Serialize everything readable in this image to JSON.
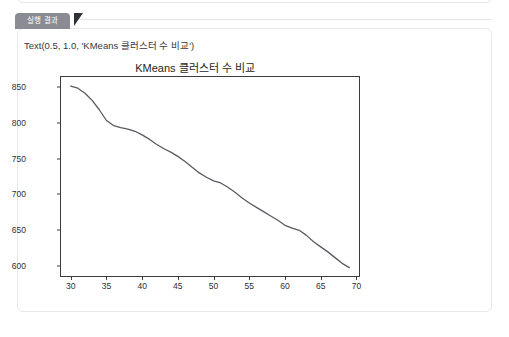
{
  "panel": {
    "tab_label": "실행 결과"
  },
  "output": {
    "repr_text": "Text(0.5, 1.0, 'KMeans 클러스터 수 비교')"
  },
  "colors": {
    "tab_background": "#8b8b93",
    "tab_text": "#ffffff",
    "tab_pointer": "#2f3135",
    "card_background": "#ffffff",
    "card_border": "#e6e8ea",
    "line": "#595b60",
    "axis": "#3b3d41",
    "tick_text": "#2e3034"
  },
  "chart_data": {
    "type": "line",
    "title": "KMeans 클러스터 수 비교",
    "xlabel": "",
    "ylabel": "",
    "xlim": [
      28.5,
      70.5
    ],
    "ylim": [
      585,
      865
    ],
    "grid": false,
    "legend": null,
    "xticks": [
      30,
      35,
      40,
      45,
      50,
      55,
      60,
      65,
      70
    ],
    "yticks": [
      600,
      650,
      700,
      750,
      800,
      850
    ],
    "series": [
      {
        "name": "inertia",
        "color": "#595b60",
        "x": [
          30,
          31,
          32,
          33,
          34,
          35,
          36,
          37,
          38,
          39,
          40,
          41,
          42,
          43,
          44,
          45,
          46,
          47,
          48,
          49,
          50,
          51,
          52,
          53,
          54,
          55,
          56,
          57,
          58,
          59,
          60,
          61,
          62,
          63,
          64,
          65,
          66,
          67,
          68,
          69
        ],
        "y": [
          851,
          848,
          841,
          831,
          818,
          803,
          796,
          793,
          791,
          788,
          783,
          777,
          770,
          764,
          759,
          753,
          746,
          738,
          730,
          724,
          719,
          716,
          710,
          703,
          695,
          688,
          682,
          676,
          670,
          664,
          657,
          653,
          650,
          643,
          634,
          627,
          620,
          612,
          604,
          598
        ]
      }
    ]
  }
}
